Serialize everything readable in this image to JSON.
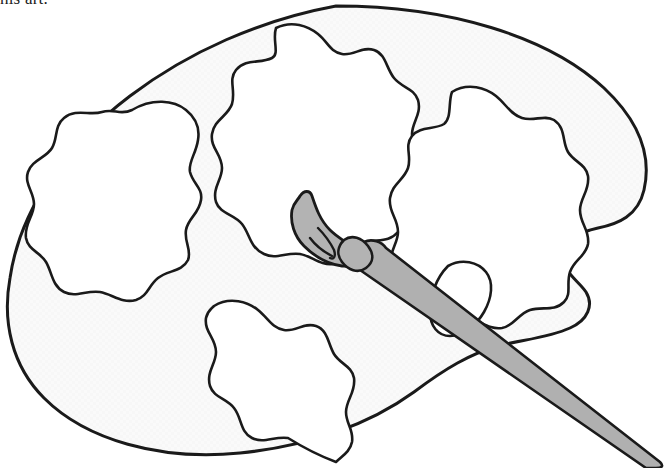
{
  "page": {
    "width": 669,
    "height": 468,
    "background_color": "#ffffff",
    "kind": "line-art-illustration"
  },
  "caption": {
    "text": "his art.",
    "note": "partial line of body text clipped by the top edge of the image",
    "color": "#1a1a1a"
  },
  "colors": {
    "outline": "#1a1a1a",
    "palette_fill": "#f7f7f7",
    "well_fill": "#ffffff",
    "brush_gray": "#b3b3b3",
    "brush_handle_gray": "#b0b0b0",
    "white": "#ffffff"
  },
  "artwork": {
    "title": "Artist's palette and paintbrush",
    "stroke_width_outer": 3.0,
    "stroke_width_inner": 2.6,
    "elements": [
      {
        "name": "palette-body",
        "label": "Palette board",
        "fill": "#f7f7f7"
      },
      {
        "name": "paint-well-top-left",
        "label": "Paint well (upper left)",
        "fill": "#ffffff"
      },
      {
        "name": "paint-well-top-center",
        "label": "Paint well (upper center)",
        "fill": "#ffffff"
      },
      {
        "name": "paint-well-top-right",
        "label": "Paint well (upper right)",
        "fill": "#ffffff"
      },
      {
        "name": "paint-well-bottom-center",
        "label": "Paint well (lower center)",
        "fill": "#ffffff"
      },
      {
        "name": "thumb-hole",
        "label": "Thumb hole",
        "fill": "#ffffff"
      },
      {
        "name": "brush-bristles",
        "label": "Brush bristle tip",
        "fill": "#b3b3b3"
      },
      {
        "name": "brush-ferrule",
        "label": "Brush ferrule band",
        "fill": "#b3b3b3"
      },
      {
        "name": "brush-handle",
        "label": "Brush handle",
        "fill": "#b0b0b0"
      }
    ],
    "well_count": 4
  },
  "paths": {
    "palette_outer": "M 336 6 C 448 6 548 36 604 88 C 638 120 652 155 644 190 C 638 216 618 224 598 228 C 580 232 566 240 564 255 C 562 272 578 280 586 292 C 594 305 588 320 570 328 C 548 338 520 340 498 346 C 470 354 446 368 414 392 C 370 424 310 446 240 453 C 160 461 86 440 44 398 C 12 366 2 322 10 278 C 20 210 64 146 130 96 C 188 52 260 20 336 6 Z",
    "well_top_left": "M 132 110 C 152 98 174 100 186 110 C 196 118 200 128 198 140 C 196 154 188 162 190 172 C 193 184 203 188 201 200 C 199 214 188 218 186 230 C 184 242 192 250 188 260 C 182 272 168 270 158 278 C 148 286 148 296 136 300 C 122 304 112 294 100 292 C 86 290 76 298 64 292 C 52 286 52 272 46 262 C 40 252 28 250 26 238 C 24 224 34 216 34 204 C 34 192 24 184 28 172 C 32 160 46 158 52 148 C 58 138 54 126 64 118 C 76 108 90 116 102 112 C 114 108 120 116 132 110 Z",
    "well_top_center": "M 276 28 C 292 20 308 26 318 34 C 328 42 330 52 342 54 C 354 56 362 46 374 50 C 386 54 386 68 394 78 C 402 88 414 88 418 100 C 422 114 412 122 412 134 C 412 148 422 154 420 168 C 418 182 406 186 402 198 C 398 212 406 222 398 232 C 388 244 374 238 362 244 C 350 250 348 262 334 264 C 320 266 312 256 300 254 C 286 252 276 260 264 254 C 250 248 250 234 242 224 C 234 214 220 214 216 202 C 212 188 222 180 222 168 C 222 154 210 148 212 134 C 214 120 228 116 232 104 C 236 90 228 80 236 70 C 246 58 260 64 272 58 C 280 54 272 40 276 28 Z",
    "well_top_right": "M 452 92 C 468 82 486 88 496 96 C 506 104 510 114 522 118 C 534 122 544 114 554 120 C 566 128 562 142 568 152 C 574 162 586 164 588 176 C 590 190 580 198 580 210 C 580 224 590 230 588 244 C 586 256 574 260 570 272 C 566 284 572 294 564 302 C 554 312 542 306 530 310 C 518 314 514 326 502 328 C 488 330 480 320 468 318 C 456 316 446 324 434 318 C 422 312 424 298 416 288 C 408 278 396 278 392 266 C 388 252 398 244 398 232 C 398 218 388 212 390 198 C 392 184 404 180 408 168 C 412 156 404 146 412 136 C 420 126 434 130 444 124 C 452 118 448 102 452 92 Z",
    "well_bottom": "M 214 306 C 230 296 248 302 258 310 C 268 318 272 328 284 330 C 296 332 304 322 316 326 C 328 330 328 344 334 354 C 340 364 352 366 354 378 C 356 392 346 400 346 412 C 346 424 354 430 352 442 C 350 452 342 456 336 462 C 320 456 304 448 288 438 C 274 436 264 444 252 438 C 240 432 242 418 234 408 C 226 398 214 398 210 386 C 206 372 216 364 216 352 C 216 338 204 332 206 318 C 208 310 210 310 214 306 Z",
    "thumb_hole": "M 448 266 C 462 258 478 262 486 272 C 494 282 492 298 484 312 C 476 326 462 336 450 336 C 438 336 430 326 430 312 C 430 296 436 278 448 266 Z",
    "brush_bristles": "M 300 196 C 304 190 310 190 312 196 C 316 208 320 220 330 230 C 340 240 352 244 356 252 C 360 262 352 268 342 266 C 328 264 314 256 304 246 C 294 236 290 222 292 210 C 294 202 298 200 300 196 Z",
    "bristle_line_1": "M 318 228 C 324 234 330 242 334 250 C 336 256 334 260 330 258",
    "bristle_line_2": "M 310 238 C 316 246 324 252 332 256",
    "brush_ferrule": "M 344 240 C 352 234 362 238 368 246 C 374 254 374 262 366 268 C 358 274 348 270 342 262 C 336 254 338 246 344 240 Z",
    "brush_handle": "M 364 242 C 372 238 382 242 386 248 L 660 462 C 664 466 662 468 656 468 L 646 468 L 360 270 C 354 266 354 256 358 248 Z"
  }
}
